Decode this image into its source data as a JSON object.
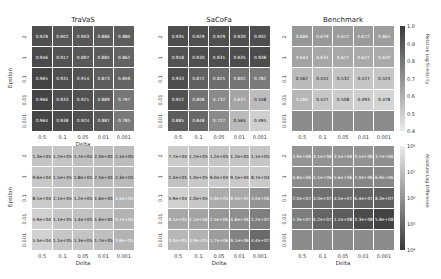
{
  "chart_data": [
    {
      "type": "heatmap",
      "title": "TraVaS",
      "xlabel": "Delta",
      "ylabel": "Epsilon",
      "x": [
        "0.5",
        "0.1",
        "0.05",
        "0.01",
        "0.001"
      ],
      "y": [
        "2",
        "1",
        "0.1",
        "0.01",
        "0.001"
      ],
      "metric": "Relative Log Similarity",
      "values": [
        [
          "0.928",
          "0.902",
          "0.903",
          "0.886",
          "0.880"
        ],
        [
          "0.946",
          "0.917",
          "0.897",
          "0.885",
          "0.862"
        ],
        [
          "0.965",
          "0.931",
          "0.914",
          "0.873",
          "0.859"
        ],
        [
          "0.966",
          "0.933",
          "0.921",
          "0.889",
          "0.797"
        ],
        [
          "0.964",
          "0.938",
          "0.924",
          "0.887",
          "0.785"
        ]
      ]
    },
    {
      "type": "heatmap",
      "title": "SaCoFa",
      "xlabel": "",
      "ylabel": "",
      "x": [
        "0.5",
        "0.1",
        "0.05",
        "0.01",
        "0.001"
      ],
      "y": [
        "2",
        "1",
        "0.1",
        "0.01",
        "0.001"
      ],
      "metric": "Relative Log Similarity",
      "values": [
        [
          "0.935",
          "0.929",
          "0.929",
          "0.930",
          "0.932"
        ],
        [
          "0.918",
          "0.930",
          "0.931",
          "0.935",
          "0.938"
        ],
        [
          "0.933",
          "0.872",
          "0.825",
          "0.802",
          "0.782"
        ],
        [
          "0.922",
          "0.808",
          "0.732",
          "0.637",
          "0.558"
        ],
        [
          "0.885",
          "0.848",
          "0.727",
          "0.565",
          "0.495"
        ]
      ]
    },
    {
      "type": "heatmap",
      "title": "Benchmark",
      "xlabel": "",
      "ylabel": "",
      "x": [
        "0.5",
        "0.1",
        "0.05",
        "0.01",
        "0.001"
      ],
      "y": [
        "2",
        "1",
        "0.1",
        "0.01",
        "0.001"
      ],
      "metric": "Relative Log Similarity",
      "values": [
        [
          "0.686",
          "0.679",
          "0.672",
          "0.672",
          "0.665"
        ],
        [
          "0.643",
          "0.631",
          "0.627",
          "0.621",
          "0.620"
        ],
        [
          "0.562",
          "0.551",
          "0.532",
          "0.527",
          "0.524"
        ],
        [
          "0.580",
          "0.527",
          "0.508",
          "0.493",
          "0.478"
        ],
        [
          null,
          null,
          null,
          null,
          null
        ]
      ]
    },
    {
      "type": "heatmap",
      "title": "",
      "xlabel": "Delta",
      "ylabel": "Epsilon",
      "x": [
        "0.5",
        "0.1",
        "0.05",
        "0.01",
        "0.001"
      ],
      "y": [
        "2",
        "1",
        "0.1",
        "0.01",
        "0.001"
      ],
      "metric": "Absolute Log Difference",
      "values": [
        [
          "1.3e+05",
          "1.2e+05",
          "1.7e+05",
          "2.0e+05",
          "2.1e+05"
        ],
        [
          "9.6e+04",
          "1.5e+05",
          "1.8e+05",
          "2.5e+05",
          "2.3e+05"
        ],
        [
          "8.1e+04",
          "1.1e+05",
          "1.2e+05",
          "1.6e+05",
          "3.4e+05"
        ],
        [
          "5.9e+04",
          "1.1e+05",
          "1.4e+05",
          "1.6e+05",
          "3.7e+05"
        ],
        [
          "5.5e+04",
          "1.1e+05",
          "1.3e+05",
          "1.7e+05",
          "3.8e+05"
        ]
      ]
    },
    {
      "type": "heatmap",
      "title": "",
      "xlabel": "Delta",
      "ylabel": "",
      "x": [
        "0.5",
        "0.1",
        "0.05",
        "0.01",
        "0.001"
      ],
      "y": [
        "2",
        "1",
        "0.1",
        "0.01",
        "0.001"
      ],
      "metric": "Absolute Log Difference",
      "values": [
        [
          "7.7e+04",
          "1.2e+05",
          "1.2e+05",
          "1.2e+05",
          "1.1e+05"
        ],
        [
          "1.4e+05",
          "1.0e+05",
          "9.0e+04",
          "9.1e+04",
          "8.7e+04"
        ],
        [
          "5.9e+04",
          "1.0e+05",
          "5.9e+05",
          "8.0e+05",
          "3.0e+06"
        ],
        [
          "8.1e+05",
          "1.1e+06",
          "2.5e+06",
          "4.6e+06",
          "1.2e+07"
        ],
        [
          "3.0e+05",
          "3.9e+05",
          "1.7e+06",
          "9.1e+06",
          "4.4e+07"
        ]
      ]
    },
    {
      "type": "heatmap",
      "title": "",
      "xlabel": "Delta",
      "ylabel": "",
      "x": [
        "0.5",
        "0.1",
        "0.05",
        "0.01",
        "0.001"
      ],
      "y": [
        "2",
        "1",
        "0.1",
        "0.01",
        "0.001"
      ],
      "metric": "Absolute Log Difference",
      "values": [
        [
          "2.9e+06",
          "3.1e+06",
          "3.5e+06",
          "3.1e+06",
          "3.7e+06"
        ],
        [
          "4.8e+06",
          "5.1e+06",
          "5.6e+06",
          "7.0e+06",
          "6.9e+06"
        ],
        [
          "2.0e+07",
          "3.0e+07",
          "4.5e+07",
          "6.4e+07",
          "8.3e+07"
        ],
        [
          "1.3e+07",
          "6.2e+07",
          "1.1e+08",
          "3.3e+08",
          "5.8e+08"
        ],
        [
          null,
          null,
          null,
          null,
          null
        ]
      ]
    }
  ],
  "colorbars": {
    "top": {
      "label": "Relative Log Similarity",
      "ticks": [
        "1.0",
        "0.9",
        "0.8",
        "0.7",
        "0.6",
        "0.5",
        "0.4"
      ],
      "range": [
        0.4,
        1.0
      ]
    },
    "bottom": {
      "label": "Absolute Log Difference",
      "ticks": [
        "10⁸",
        "10⁷",
        "10⁶",
        "10⁵",
        "10⁴"
      ],
      "range": [
        10000,
        1000000000
      ]
    }
  },
  "colors": {
    "nan": "#8c8c8c",
    "dark": "#3a3a3a",
    "light": "#e8e8e8"
  }
}
